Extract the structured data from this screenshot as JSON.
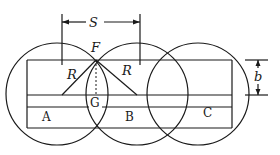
{
  "diagram": {
    "title": "",
    "labels": {
      "spacing": "S",
      "intersection_top": "F",
      "intersection_mid": "G",
      "radius_left": "R",
      "radius_right": "R",
      "width": "b",
      "region_a": "A",
      "region_b": "B",
      "region_c": "C"
    },
    "circles": [
      {
        "id": "A",
        "cx": 57,
        "cy": 94,
        "r": 51
      },
      {
        "id": "B",
        "cx": 137,
        "cy": 94,
        "r": 51
      },
      {
        "id": "C",
        "cx": 198,
        "cy": 94,
        "r": 51
      }
    ],
    "colors": {
      "stroke": "#1a1a1a",
      "background": "#ffffff"
    }
  }
}
